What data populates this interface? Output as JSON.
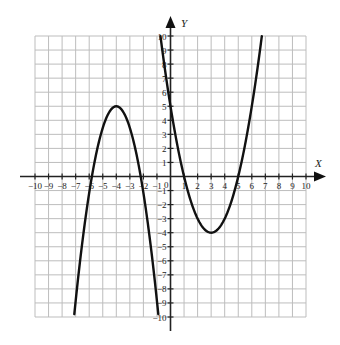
{
  "chart_data": {
    "type": "line",
    "title": "",
    "xlabel": "X",
    "ylabel": "Y",
    "xlim": [
      -10,
      10
    ],
    "ylim": [
      -10,
      10
    ],
    "grid": true,
    "x_ticks": [
      -10,
      -9,
      -8,
      -7,
      -6,
      -5,
      -4,
      -3,
      -2,
      -1,
      1,
      2,
      3,
      4,
      5,
      6,
      7,
      8,
      9,
      10
    ],
    "y_ticks": [
      -10,
      -9,
      -8,
      -7,
      -6,
      -5,
      -4,
      -3,
      -2,
      -1,
      1,
      2,
      3,
      4,
      5,
      6,
      7,
      8,
      9,
      10
    ],
    "origin_label": "0",
    "series": [
      {
        "name": "left-parabola",
        "description": "Downward-opening parabola, vertex (-4, 5), x-intercepts ≈ -5.8 and -2.2",
        "equation_estimate": "y = -1.54(x + 4)^2 + 5",
        "x": [
          -7.1,
          -6.5,
          -6,
          -5.5,
          -5,
          -4.5,
          -4,
          -3.5,
          -3,
          -2.5,
          -2,
          -1.5,
          -0.9
        ],
        "y": [
          -10,
          -4.6,
          -1.2,
          1.5,
          3.5,
          4.6,
          5,
          4.6,
          3.5,
          1.5,
          -1.2,
          -4.6,
          -10
        ]
      },
      {
        "name": "right-parabola",
        "description": "Upward-opening parabola, vertex (3, -4), x-intercepts 1 and 5, y-intercept 5",
        "equation_estimate": "y = (x - 3)^2 - 4",
        "x": [
          -0.74,
          0,
          0.5,
          1,
          1.5,
          2,
          2.5,
          3,
          3.5,
          4,
          4.5,
          5,
          5.5,
          6,
          6.74
        ],
        "y": [
          10,
          5,
          2.25,
          0,
          -1.75,
          -3,
          -3.75,
          -4,
          -3.75,
          -3,
          -1.75,
          0,
          2.25,
          5,
          10
        ]
      }
    ]
  }
}
